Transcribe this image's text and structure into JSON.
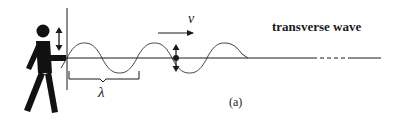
{
  "diagram": {
    "title": "transverse wave",
    "velocity_label": "v",
    "wavelength_label": "λ",
    "caption": "(a)",
    "elements": {
      "person": "person-icon",
      "wall": "vertical-line",
      "wave": "sine-wave",
      "axis": "horizontal-axis-with-dashed-break",
      "particle": "oscillating-particle-dot",
      "velocity_arrow": "right-arrow",
      "hand_motion_arrow": "up-down-double-arrow",
      "wavelength_bracket": "bracket"
    },
    "colors": {
      "ink": "#1a1a1a",
      "wave": "#3a3a3a",
      "background": "#ffffff"
    }
  }
}
